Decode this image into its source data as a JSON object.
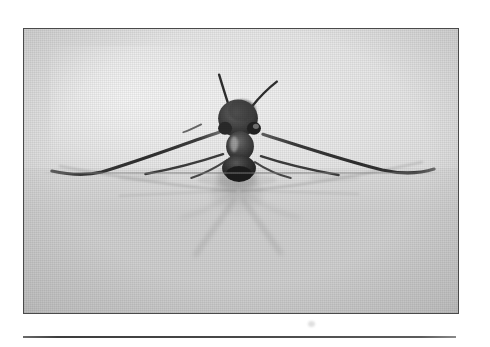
{
  "page": {
    "background_color": "#ffffff",
    "width": 490,
    "height": 347
  },
  "figure": {
    "name": "framed-photograph",
    "border_color": "#4a4a4a",
    "frame": {
      "left": 23,
      "top": 28,
      "width": 436,
      "height": 286
    },
    "photo": {
      "tone": "black-and-white",
      "background_color": "#e4e4e4",
      "highlight_color": "#f2f2f2",
      "shadow_color": "#c6c6c6",
      "subject_color": "#3a3a3a"
    }
  },
  "rule": {
    "name": "horizontal-rule",
    "color": "#4a4a4a",
    "left": 23,
    "top": 336,
    "width": 433
  },
  "artifacts": {
    "scan_speck_label": "scanner-speck"
  },
  "insect": {
    "type": "water-strider",
    "parts": [
      "head",
      "antenna-left",
      "antenna-right",
      "eye-left",
      "eye-right",
      "thorax",
      "abdomen",
      "foreleg-left",
      "foreleg-right",
      "midleg-left",
      "midleg-right",
      "hindleg-left",
      "hindleg-right"
    ],
    "reflection": "mirrored body and legs beneath the waterline"
  }
}
